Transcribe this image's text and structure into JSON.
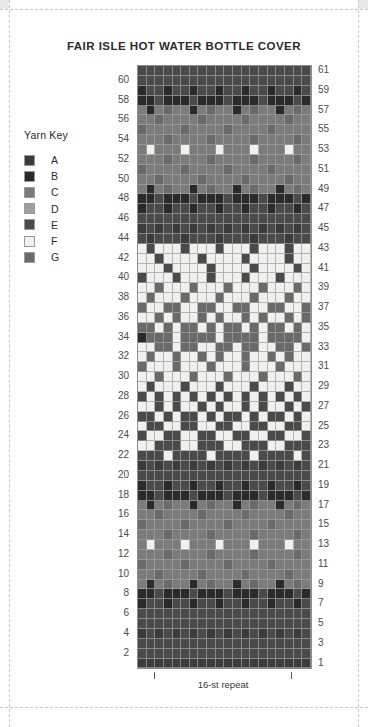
{
  "title": "FAIR ISLE HOT WATER BOTTLE COVER",
  "key": {
    "heading": "Yarn Key",
    "items": [
      {
        "label": "A",
        "color": "#3b3b3b"
      },
      {
        "label": "B",
        "color": "#2a2a2a"
      },
      {
        "label": "C",
        "color": "#7b7b7b"
      },
      {
        "label": "D",
        "color": "#a0a0a0"
      },
      {
        "label": "E",
        "color": "#4a4a4a"
      },
      {
        "label": "F",
        "color": "#f0f0ec"
      },
      {
        "label": "G",
        "color": "#6a6a6a"
      }
    ]
  },
  "repeat": {
    "label": "16-st repeat"
  },
  "chart_data": {
    "type": "heatmap",
    "title": "FAIR ISLE HOT WATER BOTTLE COVER",
    "xlabel": "",
    "ylabel": "",
    "columns": 20,
    "rows": 61,
    "row_labels_left": [
      60,
      58,
      56,
      54,
      52,
      50,
      48,
      46,
      44,
      42,
      40,
      38,
      36,
      34,
      32,
      30,
      28,
      26,
      24,
      22,
      20,
      18,
      16,
      14,
      12,
      10,
      8,
      6,
      4,
      2
    ],
    "row_labels_right": [
      61,
      59,
      57,
      55,
      53,
      51,
      49,
      47,
      45,
      43,
      41,
      39,
      37,
      35,
      33,
      31,
      29,
      27,
      25,
      23,
      21,
      19,
      17,
      15,
      13,
      11,
      9,
      7,
      5,
      3,
      1
    ],
    "palette": {
      "A": "#3b3b3b",
      "B": "#2a2a2a",
      "C": "#7b7b7b",
      "D": "#a0a0a0",
      "E": "#4a4a4a",
      "F": "#f0f0ec",
      "G": "#6a6a6a"
    },
    "legend": [
      "A",
      "B",
      "C",
      "D",
      "E",
      "F",
      "G"
    ],
    "legend_position": "left",
    "grid": true,
    "note": "rows listed top (row 61) to bottom (row 1); each string is 20 colour codes left-to-right",
    "cells": [
      "EEEEEEEEEEEEEEEEEEEE",
      "EEEEEEEEEEEEEEEEEEEE",
      "BEEBEEBEEBEEBEEBEEBE",
      "BBEBBBEBBBEBBBEBBBEB",
      "CBCGCCBCGCCBCGCCBCGC",
      "CCGCCCCGCCCCGCCCCGCC",
      "GCCCCGCCCCGCCCCGCCCC",
      "CCCGCCCCGCCCCGCCCCGC",
      "CFCCCFCCCFCCCFCCCFCC",
      "CCCGCCCCGCCCCGCCCCGC",
      "GCCCCGCCCCGCCCCGCCCC",
      "CCGCCCCGCCCCGCCCCGCC",
      "CBCGCCBCGCCBCGCCBCGC",
      "BBEBBBEBBBEBBBEBBBEB",
      "BEEBEEBEEBEEBEEBEEBE",
      "EEEEEEEEEEEEEEEEEEEE",
      "AEAEAEAEAEAEAEAEAEAE",
      "EAEEEAEEEAEEEAEEEAEE",
      "FEFFFEFFFEFFFEFFFEFF",
      "FFEFFFFEFFFFEFFFFEFF",
      "FFFEFFFFEFFFFEFFFFEF",
      "EFFFEFFFEFFFEFFFEFFF",
      "FFGFFFGFFFGFFFGFFFGF",
      "FGFFFGFFFGFFFGFFFGFF",
      "GFFGGFFGGFFGGFFGGFFG",
      "FFGFGFFGFGFFGFGFFGFG",
      "GGFGFGGFGFGGFGFGGFGF",
      "BGGGFGGGGFGGGGFGGGGF",
      "FFGGFGGFFGGFGGFFGGFG",
      "FGFFGFFGFGFFGFFGFGFF",
      "GFFFGFFFGFFFGFFFGFFF",
      "FFGFFFGFFFGFFFGFFFGF",
      "FEFFFEFFFEFFFEFFFEFF",
      "EFEFEFEFEFEFEFEFEFEF",
      "FFEFEFFEFEFFEFEFFEFE",
      "EEFEFEEFEFEEFEFEEFEF",
      "FEEFFEEFFEEFFEEFFEEF",
      "EFFEEFFEEFFEEFFEEFFE",
      "FFEEEFFEEEFFEEEFFEEE",
      "EEEFEEEEFEEEEFEEEEFE",
      "AEAEAEAEAEAEAEAEAEAE",
      "EEEEEEEEEEEEEEEEEEEE",
      "BEEBEEBEEBEEBEEBEEBE",
      "BBEBBBEBBBEBBBEBBBEB",
      "CBCGCCBCGCCBCGCCBCGC",
      "CCGCCCCGCCCCGCCCCGCC",
      "GCCCCGCCCCGCCCCGCCCC",
      "CCCGCCCCGCCCCGCCCCGC",
      "CFCCCFCCCFCCCFCCCFCC",
      "CCCGCCCCGCCCCGCCCCGC",
      "GCCCCGCCCCGCCCCGCCCC",
      "CCGCCCCGCCCCGCCCCGCC",
      "CBCGCCBCGCCBCGCCBCGC",
      "BBEBBBEBBBEBBBEBBBEB",
      "BEEBEEBEEBEEBEEBEEBE",
      "EEEEEEEEEEEEEEEEEEEE",
      "EEEEEEEEEEEEEEEEEEEE",
      "AEAEAEAEAEAEAEAEAEAE",
      "EEEEEEEEEEEEEEEEEEEE",
      "EEEEEEEEEEEEEEEEEEEE",
      "AAAAAAAAAAAAAAAAAAAA"
    ]
  }
}
